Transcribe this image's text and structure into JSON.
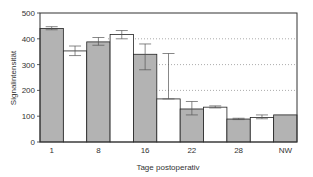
{
  "chart_data": {
    "type": "bar",
    "title": "",
    "xlabel": "Tage postoperativ",
    "ylabel": "Signalintensität",
    "ylim": [
      0,
      500
    ],
    "yticks": [
      0,
      100,
      200,
      300,
      400,
      500
    ],
    "grid": "dotted horizontal lines at 200, 300, 400 (right portion)",
    "categories": [
      "1",
      "8",
      "16",
      "22",
      "28",
      "NW"
    ],
    "bars": [
      {
        "group": "1",
        "fill": "gray",
        "value": 440,
        "err_low": 435,
        "err_high": 447
      },
      {
        "group": "1",
        "fill": "white",
        "value": 353,
        "err_low": 335,
        "err_high": 372
      },
      {
        "group": "8",
        "fill": "gray",
        "value": 388,
        "err_low": 375,
        "err_high": 405
      },
      {
        "group": "8",
        "fill": "white",
        "value": 417,
        "err_low": 400,
        "err_high": 432
      },
      {
        "group": "16",
        "fill": "gray",
        "value": 340,
        "err_low": 280,
        "err_high": 380
      },
      {
        "group": "16",
        "fill": "white",
        "value": 167,
        "err_low": 167,
        "err_high": 343
      },
      {
        "group": "22",
        "fill": "gray",
        "value": 128,
        "err_low": 105,
        "err_high": 157
      },
      {
        "group": "22",
        "fill": "white",
        "value": 135,
        "err_low": 132,
        "err_high": 140
      },
      {
        "group": "28",
        "fill": "gray",
        "value": 89,
        "err_low": 87,
        "err_high": 92
      },
      {
        "group": "28",
        "fill": "white",
        "value": 95,
        "err_low": 90,
        "err_high": 105
      },
      {
        "group": "NW",
        "fill": "gray",
        "value": 105,
        "err_low": 105,
        "err_high": 105
      }
    ],
    "colors": {
      "gray": "#b3b3b3",
      "white": "#ffffff",
      "edge": "#222222"
    }
  }
}
